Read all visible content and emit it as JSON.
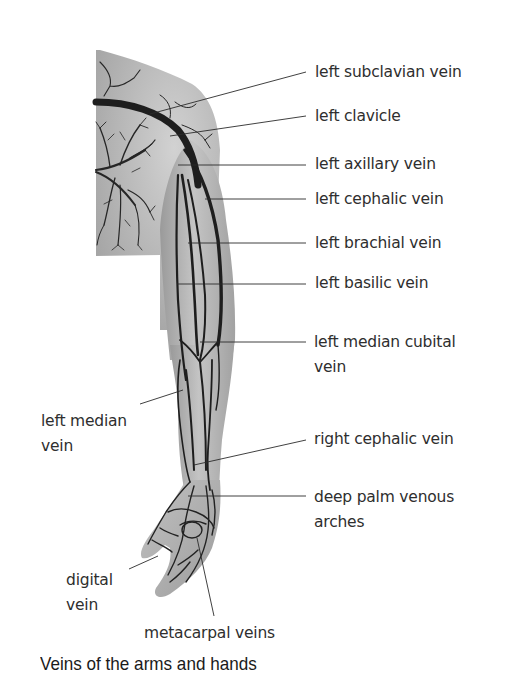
{
  "figure": {
    "title": "Veins of the arms and hands"
  },
  "labels": [
    {
      "id": "left-subclavian-vein",
      "lines": [
        "left subclavian vein"
      ],
      "x": 315,
      "y": 60,
      "anchor": [
        150,
        114
      ]
    },
    {
      "id": "left-clavicle",
      "lines": [
        "left clavicle"
      ],
      "x": 315,
      "y": 105,
      "anchor": [
        170,
        136
      ]
    },
    {
      "id": "left-axillary-vein",
      "lines": [
        "left axillary vein"
      ],
      "x": 315,
      "y": 151,
      "anchor": [
        178,
        165
      ]
    },
    {
      "id": "left-cephalic-vein",
      "lines": [
        "left cephalic vein"
      ],
      "x": 315,
      "y": 187,
      "anchor": [
        205,
        199
      ]
    },
    {
      "id": "left-brachial-vein",
      "lines": [
        "left brachial vein"
      ],
      "x": 315,
      "y": 231,
      "anchor": [
        188,
        243
      ]
    },
    {
      "id": "left-basilic-vein",
      "lines": [
        "left basilic vein"
      ],
      "x": 315,
      "y": 272,
      "anchor": [
        177,
        284
      ]
    },
    {
      "id": "left-median-cubital-vein",
      "lines": [
        "left median cubital",
        "vein"
      ],
      "x": 314,
      "y": 330,
      "anchor": [
        200,
        342
      ]
    },
    {
      "id": "left-median-vein",
      "lines": [
        "left median",
        "vein"
      ],
      "x": 41,
      "y": 409,
      "anchor": [
        183,
        390
      ],
      "line_start": [
        140,
        404
      ]
    },
    {
      "id": "right-cephalic-vein",
      "lines": [
        "right cephalic vein"
      ],
      "x": 314,
      "y": 426,
      "anchor": [
        194,
        465
      ]
    },
    {
      "id": "deep-palm-venous-arches",
      "lines": [
        "deep palm venous",
        "arches"
      ],
      "x": 314,
      "y": 485,
      "anchor": [
        188,
        496
      ]
    },
    {
      "id": "digital-vein",
      "lines": [
        "digital",
        "vein"
      ],
      "x": 66,
      "y": 568,
      "anchor": [
        158,
        556
      ],
      "line_start": [
        129,
        569
      ]
    },
    {
      "id": "metacarpal-veins",
      "lines": [
        "metacarpal veins"
      ],
      "x": 144,
      "y": 621,
      "anchor": [
        197,
        538
      ],
      "line_start": [
        214,
        616
      ]
    }
  ],
  "colors": {
    "skin_light": "#c9c9c9",
    "skin_mid": "#a8a8a8",
    "skin_dark": "#8c8c8c",
    "vein": "#1e1e1e",
    "leader_line": "#2b2b2b",
    "text": "#2e2e2e",
    "background": "#ffffff"
  }
}
